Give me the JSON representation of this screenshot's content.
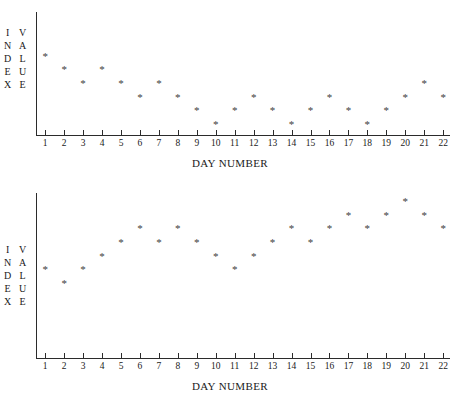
{
  "figure": {
    "background_color": "#ffffff",
    "axis_color": "#2b2b2b",
    "marker_color": "#3d3d3d",
    "marker_glyph": "*"
  },
  "charts": [
    {
      "id": "chart-top",
      "xlabel": "DAY NUMBER",
      "ylabel_left": "INDEX",
      "ylabel_right": "VALUE",
      "ylabel_left_letters": [
        "I",
        "N",
        "D",
        "E",
        "X"
      ],
      "ylabel_right_letters": [
        "V",
        "A",
        "L",
        "U",
        "E"
      ],
      "xticks": [
        "1",
        "2",
        "3",
        "4",
        "5",
        "6",
        "7",
        "8",
        "9",
        "10",
        "11",
        "12",
        "13",
        "14",
        "15",
        "16",
        "17",
        "18",
        "19",
        "20",
        "21",
        "22"
      ],
      "yticks": [],
      "values": [
        11,
        9,
        7,
        9,
        7,
        5,
        7,
        5,
        3,
        1,
        3,
        5,
        3,
        1,
        3,
        5,
        3,
        1,
        3,
        5,
        7,
        5
      ]
    },
    {
      "id": "chart-bottom",
      "xlabel": "DAY NUMBER",
      "ylabel_left": "INDEX",
      "ylabel_right": "VALUE",
      "ylabel_left_letters": [
        "I",
        "N",
        "D",
        "E",
        "X"
      ],
      "ylabel_right_letters": [
        "V",
        "A",
        "L",
        "U",
        "E"
      ],
      "xticks": [
        "1",
        "2",
        "3",
        "4",
        "5",
        "6",
        "7",
        "8",
        "9",
        "10",
        "11",
        "12",
        "13",
        "14",
        "15",
        "16",
        "17",
        "18",
        "19",
        "20",
        "21",
        "22"
      ],
      "yticks": [],
      "values": [
        3,
        2,
        3,
        4,
        5,
        6,
        5,
        6,
        5,
        4,
        3,
        4,
        5,
        6,
        5,
        6,
        7,
        6,
        7,
        8,
        7,
        6
      ]
    }
  ],
  "chart_data": [
    {
      "type": "scatter",
      "title": "",
      "xlabel": "DAY NUMBER",
      "ylabel": "INDEX VALUE",
      "x": [
        1,
        2,
        3,
        4,
        5,
        6,
        7,
        8,
        9,
        10,
        11,
        12,
        13,
        14,
        15,
        16,
        17,
        18,
        19,
        20,
        21,
        22
      ],
      "values": [
        11,
        9,
        7,
        9,
        7,
        5,
        7,
        5,
        3,
        1,
        3,
        5,
        3,
        1,
        3,
        5,
        3,
        1,
        3,
        5,
        7,
        5
      ],
      "xtick_labels": [
        "1",
        "2",
        "3",
        "4",
        "5",
        "6",
        "7",
        "8",
        "9",
        "10",
        "11",
        "12",
        "13",
        "14",
        "15",
        "16",
        "17",
        "18",
        "19",
        "20",
        "21",
        "22"
      ],
      "ytick_labels": [],
      "xlim": [
        0.5,
        22.5
      ],
      "ylim": [
        0,
        12
      ],
      "grid": false,
      "legend": false,
      "marker": "*",
      "note": "Unlabeled vertical axis; values read from relative marker heights. Series declines from day 1 to a minimum near day 10, then oscillates and rises slightly toward day 21."
    },
    {
      "type": "scatter",
      "title": "",
      "xlabel": "DAY NUMBER",
      "ylabel": "INDEX VALUE",
      "x": [
        1,
        2,
        3,
        4,
        5,
        6,
        7,
        8,
        9,
        10,
        11,
        12,
        13,
        14,
        15,
        16,
        17,
        18,
        19,
        20,
        21,
        22
      ],
      "values": [
        3,
        2,
        3,
        4,
        5,
        6,
        5,
        6,
        5,
        4,
        3,
        4,
        5,
        6,
        5,
        6,
        7,
        6,
        7,
        8,
        7,
        6
      ],
      "xtick_labels": [
        "1",
        "2",
        "3",
        "4",
        "5",
        "6",
        "7",
        "8",
        "9",
        "10",
        "11",
        "12",
        "13",
        "14",
        "15",
        "16",
        "17",
        "18",
        "19",
        "20",
        "21",
        "22"
      ],
      "ytick_labels": [],
      "xlim": [
        0.5,
        22.5
      ],
      "ylim": [
        0,
        10
      ],
      "grid": false,
      "legend": false,
      "marker": "*",
      "note": "Unlabeled vertical axis; values read from relative marker heights. Series rises overall with a dip near day 11, peaking at day 20."
    }
  ]
}
